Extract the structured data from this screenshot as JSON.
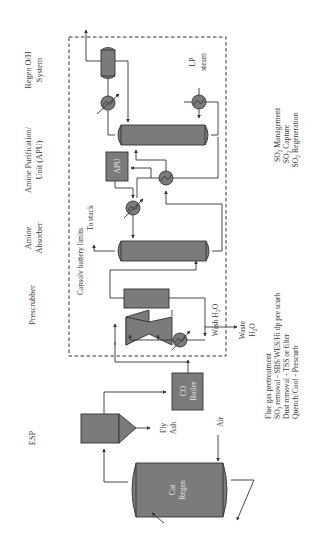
{
  "diagram": {
    "orientation": "rotated-90-ccw",
    "headers": {
      "esp": "ESP",
      "prescrubber": "Prescrubber",
      "amine_absorber_1": "Amine",
      "amine_absorber_2": "Absorber",
      "apu_1": "Amine Purification/",
      "apu_2": "Unit (APU)",
      "regen_1": "Regen O/H",
      "regen_2": "System"
    },
    "equipment": {
      "cat_regen_1": "Cat",
      "cat_regen_2": "Regen",
      "co_boiler_1": "CO",
      "co_boiler_2": "Boiler",
      "apu": "APU"
    },
    "stream_labels": {
      "fly_ash_1": "Fly",
      "fly_ash_2": "Ash",
      "air": "Air",
      "to_stack": "To stack",
      "wash_water": "Wash H",
      "wash_water_sub": "2",
      "wash_water_end": "O",
      "waste_1": "Waste",
      "waste_2": "H",
      "waste_2_sub": "2",
      "waste_2_end": "O",
      "lp_steam_1": "LP",
      "lp_steam_2": "steam",
      "battery_limits": "Cansolv battery limits"
    },
    "notes": {
      "pretreatment": [
        {
          "text": "Flue gas pretreatment",
          "sub": "",
          "rest": ""
        },
        {
          "text": "SO",
          "sub": "3",
          "rest": " removal - SBS/WES/Hi dp pre scurb"
        },
        {
          "text": "Dust removal - TSS or filter",
          "sub": "",
          "rest": ""
        },
        {
          "text": "Quench/Cool - Prescurb",
          "sub": "",
          "rest": ""
        }
      ],
      "so2": [
        {
          "text": "SO",
          "sub": "2",
          "rest": " Management"
        },
        {
          "text": "SO",
          "sub": "2",
          "rest": " Capture"
        },
        {
          "text": "SO",
          "sub": "2",
          "rest": " Regeneration"
        }
      ]
    },
    "colors": {
      "equipment_fill": "#7b7b7b",
      "line": "#333333",
      "text": "#3a3a3a"
    }
  }
}
